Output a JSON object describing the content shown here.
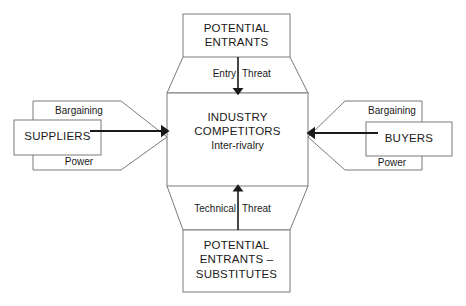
{
  "diagram": {
    "style": {
      "stroke_color": "#7a7a7a",
      "arrow_color": "#1a1a1a",
      "text_color": "#1a1a1a",
      "background": "#ffffff"
    },
    "center": {
      "line1": "INDUSTRY",
      "line2": "COMPETITORS",
      "line3": "Inter-rivalry"
    },
    "top_box": {
      "line1": "POTENTIAL",
      "line2": "ENTRANTS"
    },
    "bottom_box": {
      "line1": "POTENTIAL",
      "line2": "ENTRANTS –",
      "line3": "SUBSTITUTES"
    },
    "left_box": {
      "label": "SUPPLIERS",
      "top_label": "Bargaining",
      "bottom_label": "Power"
    },
    "right_box": {
      "label": "BUYERS",
      "top_label": "Bargaining",
      "bottom_label": "Power"
    },
    "top_arrow": {
      "left_label": "Entry",
      "right_label": "Threat"
    },
    "bottom_arrow": {
      "left_label": "Technical",
      "right_label": "Threat"
    }
  }
}
